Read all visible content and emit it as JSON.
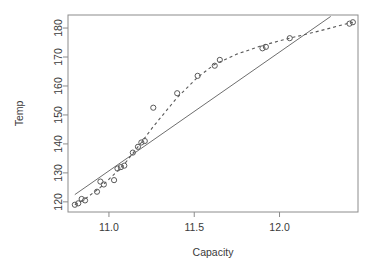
{
  "chart_data": {
    "type": "scatter",
    "title": "",
    "xlabel": "Capacity",
    "ylabel": "Temp",
    "xlim": [
      10.76,
      12.46
    ],
    "ylim": [
      116.5,
      184.5
    ],
    "xticks": [
      11.0,
      11.5,
      12.0
    ],
    "xticklabels": [
      "11.0",
      "11.5",
      "12.0"
    ],
    "yticks": [
      120,
      130,
      140,
      150,
      160,
      170,
      180
    ],
    "yticklabels": [
      "120",
      "130",
      "140",
      "150",
      "160",
      "170",
      "180"
    ],
    "grid": false,
    "legend": null,
    "box": true,
    "points": [
      {
        "x": 10.8,
        "y": 119.0
      },
      {
        "x": 10.82,
        "y": 119.5
      },
      {
        "x": 10.84,
        "y": 121.0
      },
      {
        "x": 10.86,
        "y": 120.5
      },
      {
        "x": 10.93,
        "y": 123.5
      },
      {
        "x": 10.95,
        "y": 127.0
      },
      {
        "x": 10.97,
        "y": 126.0
      },
      {
        "x": 11.03,
        "y": 127.5
      },
      {
        "x": 11.05,
        "y": 131.5
      },
      {
        "x": 11.07,
        "y": 132.0
      },
      {
        "x": 11.09,
        "y": 132.5
      },
      {
        "x": 11.14,
        "y": 137.0
      },
      {
        "x": 11.17,
        "y": 139.0
      },
      {
        "x": 11.19,
        "y": 140.5
      },
      {
        "x": 11.21,
        "y": 141.0
      },
      {
        "x": 11.26,
        "y": 152.5
      },
      {
        "x": 11.4,
        "y": 157.5
      },
      {
        "x": 11.52,
        "y": 163.5
      },
      {
        "x": 11.62,
        "y": 167.0
      },
      {
        "x": 11.65,
        "y": 169.0
      },
      {
        "x": 11.9,
        "y": 173.0
      },
      {
        "x": 11.92,
        "y": 173.5
      },
      {
        "x": 12.06,
        "y": 176.5
      },
      {
        "x": 12.41,
        "y": 181.5
      },
      {
        "x": 12.43,
        "y": 182.0
      }
    ],
    "series": [
      {
        "name": "linear-fit",
        "type": "line",
        "style": "solid",
        "x": [
          10.8,
          12.3
        ],
        "y": [
          122.5,
          184.0
        ]
      },
      {
        "name": "smooth-fit",
        "type": "line",
        "style": "dashed",
        "x": [
          10.8,
          10.86,
          10.95,
          11.03,
          11.09,
          11.19,
          11.26,
          11.4,
          11.52,
          11.62,
          11.75,
          11.9,
          12.06,
          12.2,
          12.43
        ],
        "y": [
          119.0,
          121.0,
          125.0,
          129.5,
          133.0,
          140.5,
          146.0,
          156.0,
          163.0,
          167.5,
          171.0,
          174.0,
          176.5,
          178.5,
          182.0
        ]
      }
    ]
  },
  "geometry": {
    "plot_left": 68,
    "plot_right": 358,
    "plot_top": 15,
    "plot_bottom": 212
  }
}
